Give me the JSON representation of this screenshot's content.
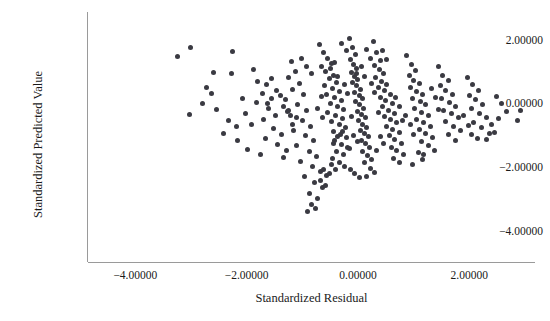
{
  "chart_data": {
    "type": "scatter",
    "title": "",
    "xlabel": "Standardized Residual",
    "ylabel": "Standardized Predicted Value",
    "xlim": [
      -4.85,
      3.18
    ],
    "ylim": [
      -4.95,
      2.9
    ],
    "xticks": [
      -4,
      -2,
      0,
      2
    ],
    "yticks": [
      2,
      0,
      -2,
      -4
    ],
    "xticklabels": [
      "-4.00000",
      "-2.00000",
      "0.00000",
      "2.00000"
    ],
    "yticklabels": [
      "2.00000",
      "0.00000",
      "-2.00000",
      "-4.00000"
    ],
    "grid": false,
    "legend": null,
    "marker": {
      "shape": "circle",
      "size_px": 5,
      "color": "#3a3a42"
    },
    "axis_color": "#9a9a9a",
    "background": "#ffffff",
    "n_points": 330,
    "points": [
      [
        -3.24,
        1.49
      ],
      [
        -3.01,
        1.78
      ],
      [
        -2.25,
        1.66
      ],
      [
        -2.6,
        1.0
      ],
      [
        -2.28,
        0.97
      ],
      [
        -2.72,
        0.52
      ],
      [
        -2.63,
        0.34
      ],
      [
        -2.79,
        0.03
      ],
      [
        -2.55,
        -0.15
      ],
      [
        -3.02,
        -0.33
      ],
      [
        -2.33,
        -0.52
      ],
      [
        -2.16,
        -1.15
      ],
      [
        -1.99,
        -1.42
      ],
      [
        -2.42,
        -0.9
      ],
      [
        -1.88,
        1.09
      ],
      [
        -1.8,
        0.72
      ],
      [
        -1.64,
        0.61
      ],
      [
        -1.72,
        0.33
      ],
      [
        -1.55,
        0.19
      ],
      [
        -1.83,
        0.05
      ],
      [
        -1.6,
        -0.14
      ],
      [
        -1.48,
        -0.34
      ],
      [
        -1.7,
        -0.47
      ],
      [
        -1.91,
        -0.62
      ],
      [
        -1.52,
        -0.75
      ],
      [
        -1.38,
        -0.95
      ],
      [
        -1.66,
        -1.08
      ],
      [
        -1.44,
        -1.26
      ],
      [
        -1.28,
        -1.44
      ],
      [
        -1.76,
        -1.56
      ],
      [
        -1.33,
        -1.67
      ],
      [
        -1.2,
        1.34
      ],
      [
        -1.12,
        1.02
      ],
      [
        -1.25,
        0.84
      ],
      [
        -1.05,
        0.66
      ],
      [
        -1.18,
        0.48
      ],
      [
        -0.98,
        0.31
      ],
      [
        -1.3,
        0.16
      ],
      [
        -1.08,
        -0.02
      ],
      [
        -0.92,
        -0.18
      ],
      [
        -1.22,
        -0.36
      ],
      [
        -1.0,
        -0.52
      ],
      [
        -0.86,
        -0.68
      ],
      [
        -1.15,
        -0.82
      ],
      [
        -0.95,
        -0.99
      ],
      [
        -0.8,
        -1.14
      ],
      [
        -1.1,
        -1.3
      ],
      [
        -0.88,
        -1.48
      ],
      [
        -0.74,
        -1.63
      ],
      [
        -1.03,
        -1.8
      ],
      [
        -0.82,
        -1.96
      ],
      [
        -0.68,
        -2.12
      ],
      [
        -0.96,
        -2.28
      ],
      [
        -0.78,
        -2.45
      ],
      [
        -0.64,
        -2.62
      ],
      [
        -0.88,
        -2.8
      ],
      [
        -0.72,
        -2.96
      ],
      [
        -0.84,
        -3.14
      ],
      [
        -0.76,
        -3.28
      ],
      [
        -0.9,
        -3.36
      ],
      [
        -0.7,
        1.88
      ],
      [
        -0.62,
        1.62
      ],
      [
        -0.55,
        1.44
      ],
      [
        -0.48,
        1.28
      ],
      [
        -0.66,
        1.18
      ],
      [
        -0.58,
        1.04
      ],
      [
        -0.44,
        0.92
      ],
      [
        -0.52,
        0.8
      ],
      [
        -0.38,
        0.7
      ],
      [
        -0.6,
        0.6
      ],
      [
        -0.46,
        0.5
      ],
      [
        -0.34,
        0.4
      ],
      [
        -0.56,
        0.32
      ],
      [
        -0.42,
        0.22
      ],
      [
        -0.3,
        0.12
      ],
      [
        -0.5,
        0.04
      ],
      [
        -0.36,
        -0.06
      ],
      [
        -0.26,
        -0.16
      ],
      [
        -0.54,
        -0.24
      ],
      [
        -0.4,
        -0.34
      ],
      [
        -0.28,
        -0.44
      ],
      [
        -0.48,
        -0.54
      ],
      [
        -0.34,
        -0.64
      ],
      [
        -0.22,
        -0.74
      ],
      [
        -0.44,
        -0.84
      ],
      [
        -0.32,
        -0.94
      ],
      [
        -0.2,
        -1.04
      ],
      [
        -0.42,
        -1.14
      ],
      [
        -0.3,
        -1.26
      ],
      [
        -0.18,
        -1.36
      ],
      [
        -0.38,
        -1.48
      ],
      [
        -0.26,
        -1.58
      ],
      [
        -0.46,
        -1.7
      ],
      [
        -0.34,
        -1.82
      ],
      [
        -0.24,
        -1.94
      ],
      [
        -0.16,
        2.08
      ],
      [
        -0.1,
        1.8
      ],
      [
        -0.04,
        1.56
      ],
      [
        -0.14,
        1.4
      ],
      [
        -0.08,
        1.26
      ],
      [
        -0.02,
        1.12
      ],
      [
        -0.12,
        1.0
      ],
      [
        -0.06,
        0.88
      ],
      [
        0.0,
        0.78
      ],
      [
        -0.1,
        0.68
      ],
      [
        -0.03,
        0.58
      ],
      [
        0.04,
        0.48
      ],
      [
        -0.07,
        0.38
      ],
      [
        0.02,
        0.28
      ],
      [
        0.08,
        0.18
      ],
      [
        -0.05,
        0.08
      ],
      [
        0.03,
        -0.02
      ],
      [
        0.1,
        -0.12
      ],
      [
        -0.01,
        -0.22
      ],
      [
        0.06,
        -0.32
      ],
      [
        0.13,
        -0.42
      ],
      [
        0.01,
        -0.52
      ],
      [
        0.08,
        -0.62
      ],
      [
        0.15,
        -0.72
      ],
      [
        0.04,
        -0.82
      ],
      [
        0.11,
        -0.92
      ],
      [
        0.18,
        -1.02
      ],
      [
        0.06,
        -1.14
      ],
      [
        0.14,
        -1.24
      ],
      [
        0.21,
        -1.36
      ],
      [
        0.09,
        -1.48
      ],
      [
        0.17,
        -1.6
      ],
      [
        0.24,
        -1.72
      ],
      [
        0.12,
        -1.84
      ],
      [
        0.28,
        1.96
      ],
      [
        0.34,
        1.62
      ],
      [
        0.4,
        1.38
      ],
      [
        0.3,
        1.22
      ],
      [
        0.38,
        1.08
      ],
      [
        0.46,
        0.96
      ],
      [
        0.32,
        0.84
      ],
      [
        0.42,
        0.72
      ],
      [
        0.52,
        0.62
      ],
      [
        0.36,
        0.52
      ],
      [
        0.48,
        0.42
      ],
      [
        0.58,
        0.32
      ],
      [
        0.4,
        0.22
      ],
      [
        0.5,
        0.12
      ],
      [
        0.62,
        0.02
      ],
      [
        0.44,
        -0.08
      ],
      [
        0.54,
        -0.18
      ],
      [
        0.66,
        -0.28
      ],
      [
        0.48,
        -0.38
      ],
      [
        0.58,
        -0.48
      ],
      [
        0.7,
        -0.58
      ],
      [
        0.52,
        -0.68
      ],
      [
        0.62,
        -0.78
      ],
      [
        0.74,
        -0.88
      ],
      [
        0.56,
        -0.98
      ],
      [
        0.66,
        -1.1
      ],
      [
        0.78,
        -1.22
      ],
      [
        0.6,
        -1.34
      ],
      [
        0.7,
        -1.46
      ],
      [
        0.82,
        -1.58
      ],
      [
        0.64,
        -1.7
      ],
      [
        0.74,
        -1.84
      ],
      [
        0.88,
        1.54
      ],
      [
        0.96,
        1.26
      ],
      [
        1.04,
        1.06
      ],
      [
        0.92,
        0.9
      ],
      [
        1.0,
        0.76
      ],
      [
        1.1,
        0.64
      ],
      [
        0.94,
        0.52
      ],
      [
        1.06,
        0.4
      ],
      [
        1.16,
        0.3
      ],
      [
        0.98,
        0.18
      ],
      [
        1.12,
        0.08
      ],
      [
        1.22,
        -0.02
      ],
      [
        1.02,
        -0.12
      ],
      [
        1.14,
        -0.24
      ],
      [
        1.26,
        -0.34
      ],
      [
        1.06,
        -0.46
      ],
      [
        1.18,
        -0.56
      ],
      [
        1.3,
        -0.68
      ],
      [
        1.1,
        -0.8
      ],
      [
        1.22,
        -0.92
      ],
      [
        1.34,
        -1.04
      ],
      [
        1.14,
        -1.16
      ],
      [
        1.26,
        -1.3
      ],
      [
        1.38,
        -1.44
      ],
      [
        1.18,
        -1.58
      ],
      [
        1.44,
        1.18
      ],
      [
        1.52,
        0.92
      ],
      [
        1.62,
        0.74
      ],
      [
        1.48,
        0.58
      ],
      [
        1.58,
        0.44
      ],
      [
        1.7,
        0.32
      ],
      [
        1.5,
        0.18
      ],
      [
        1.64,
        0.06
      ],
      [
        1.76,
        -0.06
      ],
      [
        1.54,
        -0.18
      ],
      [
        1.68,
        -0.3
      ],
      [
        1.8,
        -0.42
      ],
      [
        1.58,
        -0.54
      ],
      [
        1.72,
        -0.68
      ],
      [
        1.84,
        -0.82
      ],
      [
        1.62,
        -0.96
      ],
      [
        1.76,
        -1.12
      ],
      [
        1.96,
        0.84
      ],
      [
        2.06,
        0.62
      ],
      [
        2.16,
        0.44
      ],
      [
        2.0,
        0.28
      ],
      [
        2.12,
        0.14
      ],
      [
        2.24,
        0.0
      ],
      [
        2.04,
        -0.14
      ],
      [
        2.18,
        -0.28
      ],
      [
        2.3,
        -0.42
      ],
      [
        2.08,
        -0.58
      ],
      [
        2.22,
        -0.74
      ],
      [
        2.36,
        -0.9
      ],
      [
        2.14,
        -1.06
      ],
      [
        2.48,
        0.26
      ],
      [
        2.58,
        0.02
      ],
      [
        2.66,
        -0.22
      ],
      [
        2.52,
        -0.44
      ],
      [
        2.92,
        -0.2
      ],
      [
        2.86,
        -0.5
      ],
      [
        -0.62,
        -2.06
      ],
      [
        -0.56,
        -2.22
      ],
      [
        -0.68,
        -2.38
      ],
      [
        -0.58,
        -2.54
      ],
      [
        -0.48,
        -1.88
      ],
      [
        -0.4,
        -2.04
      ],
      [
        -0.52,
        -2.18
      ],
      [
        0.22,
        -2.0
      ],
      [
        0.3,
        -2.14
      ],
      [
        0.16,
        -2.26
      ],
      [
        -0.14,
        -2.04
      ],
      [
        -0.06,
        -2.18
      ],
      [
        0.02,
        -2.3
      ],
      [
        -0.92,
        1.2
      ],
      [
        -0.84,
        0.98
      ],
      [
        -1.02,
        1.44
      ],
      [
        0.16,
        1.72
      ],
      [
        0.22,
        1.44
      ],
      [
        -0.2,
        1.7
      ],
      [
        -0.3,
        1.92
      ],
      [
        0.44,
        1.7
      ],
      [
        0.52,
        1.42
      ],
      [
        -1.4,
        0.28
      ],
      [
        -1.34,
        -0.06
      ],
      [
        -1.26,
        -0.22
      ],
      [
        -2.08,
        0.18
      ],
      [
        -2.02,
        -0.28
      ],
      [
        -2.18,
        -0.7
      ],
      [
        0.86,
        -0.34
      ],
      [
        0.94,
        -0.64
      ],
      [
        1.0,
        -0.94
      ],
      [
        1.32,
        0.5
      ],
      [
        1.4,
        0.22
      ],
      [
        1.44,
        -0.16
      ],
      [
        1.9,
        -0.34
      ],
      [
        1.98,
        -0.66
      ],
      [
        2.04,
        -0.96
      ],
      [
        -0.66,
        0.24
      ],
      [
        -0.72,
        -0.12
      ],
      [
        -0.64,
        -0.42
      ],
      [
        -0.24,
        0.62
      ],
      [
        -0.18,
        0.34
      ],
      [
        -0.12,
        -0.38
      ],
      [
        0.24,
        0.64
      ],
      [
        0.3,
        0.36
      ],
      [
        0.36,
        -0.24
      ],
      [
        0.68,
        0.22
      ],
      [
        0.74,
        -0.08
      ],
      [
        0.8,
        -0.52
      ],
      [
        -1.56,
        0.82
      ],
      [
        -1.46,
        0.44
      ],
      [
        -1.62,
        0.02
      ],
      [
        -0.08,
        -0.98
      ],
      [
        0.0,
        -1.18
      ],
      [
        -0.16,
        -1.4
      ],
      [
        -0.44,
        -1.22
      ],
      [
        -0.36,
        -1.02
      ],
      [
        -0.28,
        -0.86
      ],
      [
        0.4,
        -1.02
      ],
      [
        0.46,
        -1.24
      ],
      [
        0.34,
        -1.44
      ],
      [
        1.08,
        -1.52
      ],
      [
        1.16,
        -1.72
      ],
      [
        0.98,
        -1.88
      ],
      [
        -1.18,
        -0.62
      ],
      [
        -1.1,
        -0.42
      ],
      [
        -1.24,
        -0.18
      ],
      [
        -0.02,
        0.96
      ],
      [
        0.06,
        1.18
      ],
      [
        0.12,
        0.86
      ],
      [
        -0.5,
        1.12
      ],
      [
        -0.42,
        1.32
      ],
      [
        -0.36,
        0.86
      ],
      [
        2.4,
        -0.62
      ],
      [
        2.46,
        -0.88
      ],
      [
        2.3,
        -1.1
      ]
    ]
  }
}
